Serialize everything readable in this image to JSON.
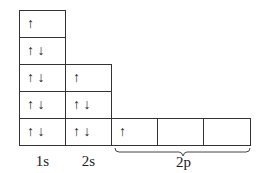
{
  "diagram": {
    "orbitals": [
      {
        "label": "1s",
        "column": 0,
        "boxes": [
          {
            "row": 0,
            "spins": "↑"
          },
          {
            "row": 1,
            "spins": "↑ ↓"
          },
          {
            "row": 2,
            "spins": "↑ ↓"
          },
          {
            "row": 3,
            "spins": "↑ ↓"
          },
          {
            "row": 4,
            "spins": "↑ ↓"
          }
        ]
      },
      {
        "label": "2s",
        "column": 1,
        "boxes": [
          {
            "row": 2,
            "spins": "↑"
          },
          {
            "row": 3,
            "spins": "↑ ↓"
          },
          {
            "row": 4,
            "spins": "↑ ↓"
          }
        ]
      },
      {
        "label": "2p",
        "columns": [
          2,
          3,
          4
        ],
        "boxes": [
          {
            "col": 2,
            "spins": "↑"
          },
          {
            "col": 3,
            "spins": ""
          },
          {
            "col": 4,
            "spins": ""
          }
        ]
      }
    ],
    "labels": {
      "s1": "1s",
      "s2": "2s",
      "p2": "2p"
    }
  }
}
